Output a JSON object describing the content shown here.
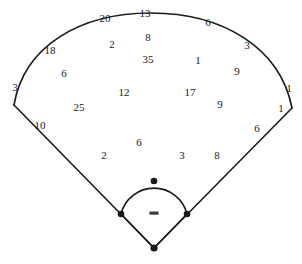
{
  "diagram": {
    "name": "baseball-field-spray-chart",
    "width": 302,
    "height": 264,
    "background_color": "#ffffff",
    "line_color": "#1a1a1a",
    "label_color": "#1a1a1a"
  },
  "field": {
    "home_plate": {
      "label": "home-plate",
      "x": 154,
      "y": 248
    },
    "first_base": {
      "label": "first-base",
      "x": 187,
      "y": 214
    },
    "second_base": {
      "label": "second-base",
      "x": 154,
      "y": 181
    },
    "third_base": {
      "label": "third-base",
      "x": 121,
      "y": 214
    },
    "pitchers_rubber": {
      "label": "pitchers-rubber",
      "x": 154,
      "y": 213,
      "width": 9,
      "height": 3
    },
    "left_foul_pole": {
      "label": "left-foul-pole-corner",
      "x": 14,
      "y": 105
    },
    "right_foul_pole": {
      "label": "right-foul-pole-corner",
      "x": 292,
      "y": 108
    },
    "outfield_arc_apex": {
      "label": "outfield-fence-apex",
      "x": 150,
      "y": 20
    }
  },
  "chart_data": {
    "type": "scatter",
    "title": "",
    "xlabel": "",
    "ylabel": "",
    "grid": false,
    "legend": "none",
    "points": [
      {
        "value": "20",
        "x": 105,
        "y": 18
      },
      {
        "value": "13",
        "x": 145,
        "y": 13
      },
      {
        "value": "6",
        "x": 208,
        "y": 22
      },
      {
        "value": "18",
        "x": 50,
        "y": 50
      },
      {
        "value": "2",
        "x": 112,
        "y": 44
      },
      {
        "value": "8",
        "x": 148,
        "y": 37
      },
      {
        "value": "3",
        "x": 247,
        "y": 45
      },
      {
        "value": "6",
        "x": 64,
        "y": 73
      },
      {
        "value": "35",
        "x": 148,
        "y": 59
      },
      {
        "value": "1",
        "x": 198,
        "y": 60
      },
      {
        "value": "9",
        "x": 237,
        "y": 71
      },
      {
        "value": "3",
        "x": 15,
        "y": 87
      },
      {
        "value": "12",
        "x": 124,
        "y": 92
      },
      {
        "value": "17",
        "x": 190,
        "y": 92
      },
      {
        "value": "1",
        "x": 289,
        "y": 88
      },
      {
        "value": "25",
        "x": 79,
        "y": 107
      },
      {
        "value": "9",
        "x": 220,
        "y": 104
      },
      {
        "value": "1",
        "x": 281,
        "y": 108
      },
      {
        "value": "10",
        "x": 40,
        "y": 125
      },
      {
        "value": "6",
        "x": 257,
        "y": 128
      },
      {
        "value": "6",
        "x": 139,
        "y": 142
      },
      {
        "value": "2",
        "x": 104,
        "y": 155
      },
      {
        "value": "3",
        "x": 182,
        "y": 155
      },
      {
        "value": "8",
        "x": 217,
        "y": 155
      }
    ]
  }
}
